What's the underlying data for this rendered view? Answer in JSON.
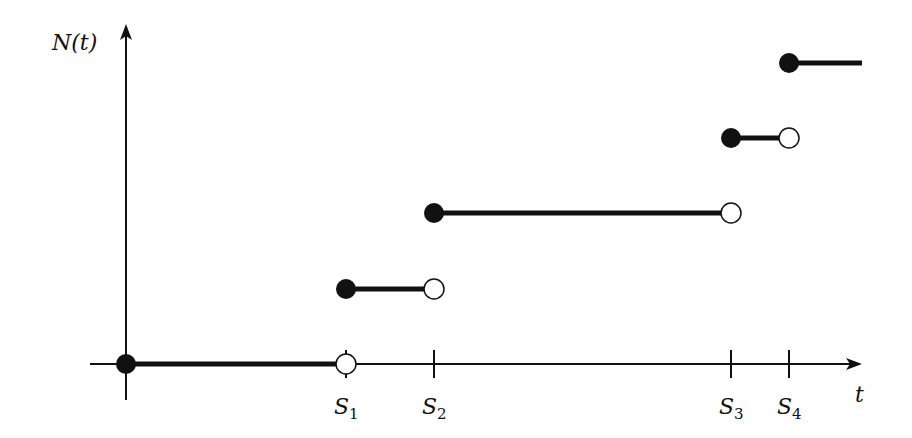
{
  "chart_data": {
    "type": "line",
    "subtype": "step-function",
    "title": "",
    "ylabel": "N(t)",
    "xlabel": "t",
    "x_ticks": [
      {
        "label": "S",
        "sub": "1",
        "x": 1
      },
      {
        "label": "S",
        "sub": "2",
        "x": 2
      },
      {
        "label": "S",
        "sub": "3",
        "x": 3
      },
      {
        "label": "S",
        "sub": "4",
        "x": 4
      }
    ],
    "steps": [
      {
        "from": "0",
        "to": "S1",
        "level": 0,
        "left": "closed",
        "right": "open"
      },
      {
        "from": "S1",
        "to": "S2",
        "level": 1,
        "left": "closed",
        "right": "open"
      },
      {
        "from": "S2",
        "to": "S3",
        "level": 2,
        "left": "closed",
        "right": "open"
      },
      {
        "from": "S3",
        "to": "S4",
        "level": 3,
        "left": "closed",
        "right": "open"
      },
      {
        "from": "S4",
        "to": "inf",
        "level": 4,
        "left": "closed",
        "right": "none"
      }
    ],
    "grid": false,
    "legend": null
  },
  "layout": {
    "origin": {
      "x": 126,
      "y": 364
    },
    "tick_px": [
      346,
      434,
      731,
      789
    ],
    "level_px": [
      364,
      289,
      213,
      138,
      63
    ],
    "x_end": 862,
    "colors": {
      "ink": "#111111",
      "bg": "#ffffff"
    }
  }
}
